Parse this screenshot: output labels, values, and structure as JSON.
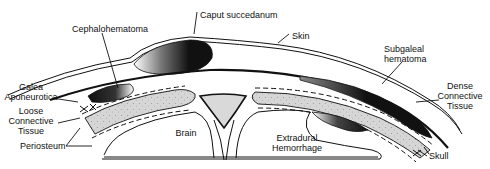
{
  "diagram": {
    "labels": {
      "caput_succedanum": "Caput succedanum",
      "cephalohematoma": "Cephalohematoma",
      "skin": "Skin",
      "subgaleal_1": "Subgaleal",
      "subgaleal_2": "hematoma",
      "galea_1": "Galea",
      "galea_2": "Aponeurotica",
      "loose_1": "Loose",
      "loose_2": "Connective",
      "loose_3": "Tissue",
      "periosteum": "Periosteum",
      "brain": "Brain",
      "extradural_1": "Extradural",
      "extradural_2": "Hemorrhage",
      "dense_1": "Dense",
      "dense_2": "Connective",
      "dense_3": "Tissue",
      "skull": "Skull"
    },
    "colors": {
      "line": "#111111",
      "background": "#ffffff",
      "bone_fill": "#d9d9d9",
      "blood_dark": "#1a1a1a"
    }
  }
}
